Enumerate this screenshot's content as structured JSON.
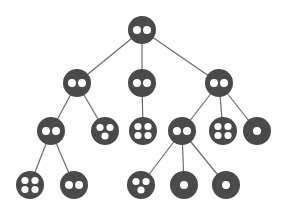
{
  "diagram": {
    "type": "tree",
    "node_color": "#4a4a4a",
    "edge_color": "#6b6b6b",
    "hole_color": "#ffffff",
    "node_radius": 14,
    "nodes": [
      {
        "id": "n0",
        "x": 142,
        "y": 30,
        "holes": 2,
        "level": 0
      },
      {
        "id": "n1",
        "x": 77,
        "y": 83,
        "holes": 2,
        "level": 1
      },
      {
        "id": "n2",
        "x": 142,
        "y": 83,
        "holes": 2,
        "level": 1
      },
      {
        "id": "n3",
        "x": 219,
        "y": 83,
        "holes": 2,
        "level": 1
      },
      {
        "id": "n4",
        "x": 51,
        "y": 131,
        "holes": 2,
        "level": 2
      },
      {
        "id": "n5",
        "x": 105,
        "y": 131,
        "holes": 3,
        "level": 2
      },
      {
        "id": "n6",
        "x": 143,
        "y": 131,
        "holes": 4,
        "level": 2
      },
      {
        "id": "n7",
        "x": 182,
        "y": 131,
        "holes": 2,
        "level": 2
      },
      {
        "id": "n8",
        "x": 223,
        "y": 131,
        "holes": 4,
        "level": 2
      },
      {
        "id": "n9",
        "x": 257,
        "y": 131,
        "holes": 1,
        "level": 2
      },
      {
        "id": "n10",
        "x": 30,
        "y": 185,
        "holes": 4,
        "level": 3
      },
      {
        "id": "n11",
        "x": 74,
        "y": 185,
        "holes": 2,
        "level": 3
      },
      {
        "id": "n12",
        "x": 141,
        "y": 185,
        "holes": 3,
        "level": 3
      },
      {
        "id": "n13",
        "x": 184,
        "y": 185,
        "holes": 1,
        "level": 3
      },
      {
        "id": "n14",
        "x": 226,
        "y": 185,
        "holes": 1,
        "level": 3
      }
    ],
    "edges": [
      [
        "n0",
        "n1"
      ],
      [
        "n0",
        "n2"
      ],
      [
        "n0",
        "n3"
      ],
      [
        "n1",
        "n4"
      ],
      [
        "n1",
        "n5"
      ],
      [
        "n2",
        "n6"
      ],
      [
        "n3",
        "n7"
      ],
      [
        "n3",
        "n8"
      ],
      [
        "n3",
        "n9"
      ],
      [
        "n4",
        "n10"
      ],
      [
        "n4",
        "n11"
      ],
      [
        "n7",
        "n12"
      ],
      [
        "n7",
        "n13"
      ],
      [
        "n7",
        "n14"
      ]
    ]
  }
}
